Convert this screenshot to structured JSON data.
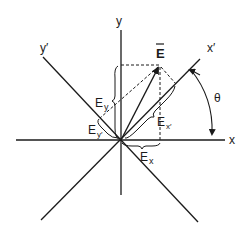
{
  "figure": {
    "axes": {
      "x": "x",
      "y": "y",
      "x_prime": "x′",
      "y_prime": "y′"
    },
    "vector": {
      "label": "E",
      "overbar": true
    },
    "components": {
      "Ex": {
        "main": "E",
        "sub": "x"
      },
      "Ey": {
        "main": "E",
        "sub": "y"
      },
      "Ex_prime": {
        "main": "E",
        "sub": "x′"
      },
      "Ey_prime": {
        "main": "E",
        "sub": "y′"
      }
    },
    "angle": {
      "label": "θ",
      "between": [
        "x",
        "x′"
      ]
    },
    "colors": {
      "ink": "#1a1a1a",
      "background": "#ffffff"
    }
  }
}
